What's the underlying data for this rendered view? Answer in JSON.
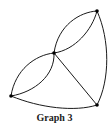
{
  "figure": {
    "caption": "Graph 3",
    "colors": {
      "stroke": "#1a1a1a",
      "vertex": "#000000",
      "background": "#ffffff"
    },
    "vertices": [
      {
        "id": "A",
        "x": 97,
        "y": 11
      },
      {
        "id": "B",
        "x": 54,
        "y": 53
      },
      {
        "id": "C",
        "x": 11,
        "y": 96
      },
      {
        "id": "D",
        "x": 97,
        "y": 105
      }
    ],
    "edges": [
      {
        "from": "B",
        "to": "A",
        "shape": "arc-upper"
      },
      {
        "from": "B",
        "to": "A",
        "shape": "arc-lower"
      },
      {
        "from": "C",
        "to": "B",
        "shape": "arc-upper"
      },
      {
        "from": "C",
        "to": "B",
        "shape": "arc-lower"
      },
      {
        "from": "B",
        "to": "D",
        "shape": "straight"
      },
      {
        "from": "A",
        "to": "D",
        "shape": "arc-right"
      },
      {
        "from": "C",
        "to": "D",
        "shape": "arc-bottom"
      }
    ]
  }
}
